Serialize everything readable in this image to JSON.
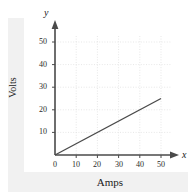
{
  "figure": {
    "background_color": "#ffffff",
    "panel_color": "#f1f1f1",
    "plate_color": "#ffffff"
  },
  "axes": {
    "x_symbol": "x",
    "y_symbol": "y",
    "x_title": "Amps",
    "y_title": "Volts",
    "axis_color": "#4a4a4a",
    "grid_color": "#d9d9d9",
    "label_color": "#2a2a2a"
  },
  "chart_data": {
    "type": "line",
    "title": "",
    "xlabel": "Amps",
    "ylabel": "Volts",
    "xlim": [
      0,
      55
    ],
    "ylim": [
      0,
      55
    ],
    "xticks": [
      0,
      10,
      20,
      30,
      40,
      50
    ],
    "ytick_labels": [
      "10",
      "20",
      "30",
      "40",
      "50"
    ],
    "xtick_labels": [
      "0",
      "10",
      "20",
      "30",
      "40",
      "50"
    ],
    "yticks": [
      10,
      20,
      30,
      40,
      50
    ],
    "grid": true,
    "grid_style": "dotted",
    "legend": false,
    "series": [
      {
        "name": "Volts vs Amps",
        "color": "#4a4a4a",
        "x": [
          0,
          50
        ],
        "y": [
          0,
          25
        ],
        "slope": 0.5,
        "intercept": 0
      }
    ]
  }
}
